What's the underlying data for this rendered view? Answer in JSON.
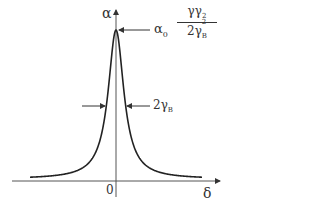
{
  "diagram": {
    "type": "lorentzian-lineshape",
    "y_axis_label": "α",
    "x_axis_label": "δ",
    "origin_label": "0",
    "peak_label": {
      "prefix": "α",
      "prefix_sub": "0",
      "numerator": "γγ",
      "numerator_sub": "2",
      "denominator": "2γ",
      "denominator_sub": "B",
      "denominator_sup": "2"
    },
    "width_label": {
      "text": "2γ",
      "sub": "B"
    },
    "colors": {
      "line": "#222222",
      "axis": "#555555",
      "text": "#333333"
    }
  }
}
